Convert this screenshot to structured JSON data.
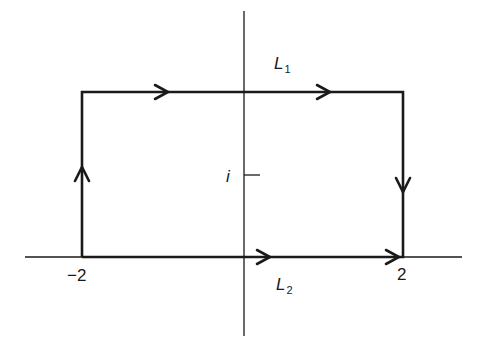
{
  "diagram": {
    "type": "contour-integral",
    "colors": {
      "stroke": "#1a1a1a",
      "background": "#ffffff"
    },
    "axes": {
      "real_axis": {
        "tick_labels": [
          "-2",
          "2"
        ]
      },
      "imaginary_axis": {
        "tick_labels": [
          "i"
        ]
      }
    },
    "labels": {
      "L1": {
        "base": "L",
        "sub": "1"
      },
      "L2": {
        "base": "L",
        "sub": "2"
      },
      "minus_two": "−2",
      "two": "2",
      "i": "i"
    },
    "segments": [
      {
        "name": "L2",
        "from": "-2",
        "to": "2",
        "direction": "right"
      },
      {
        "name": "right-side",
        "from": "2+i",
        "to": "2",
        "direction": "down"
      },
      {
        "name": "L1",
        "from": "-2+i",
        "to": "2+i",
        "direction": "right"
      },
      {
        "name": "left-side",
        "from": "-2",
        "to": "-2+i",
        "direction": "up"
      }
    ]
  }
}
